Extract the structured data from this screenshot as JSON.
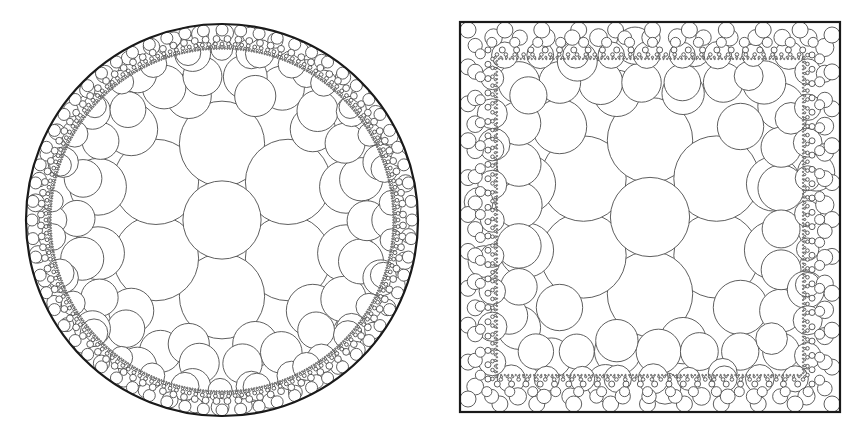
{
  "figure": {
    "background_color": "#ffffff",
    "canvas": {
      "width": 867,
      "height": 441
    },
    "stroke_color": "#4d4d4d",
    "boundary_stroke_color": "#1a1a1a",
    "fill_color": "#ffffff",
    "circle_stroke_width": 0.9,
    "boundary_stroke_width": 2.2
  },
  "panels": [
    {
      "id": "disk-packing",
      "name": "Circle packing in a disk",
      "boundary_kind": "circle",
      "origin": {
        "x": 0,
        "y": 0
      },
      "size": {
        "width": 434,
        "height": 441
      },
      "boundary": {
        "cx": 222,
        "cy": 220,
        "r": 196
      },
      "packing": {
        "seed": 20250117,
        "base_unit": 39.5,
        "center": {
          "x": 222,
          "y": 220
        },
        "rings": [
          {
            "index": 0,
            "count": 1,
            "radius_factor": 1.0,
            "ring_distance": 0.0,
            "phase_deg": 0
          },
          {
            "index": 1,
            "count": 6,
            "radius_factor": 0.93,
            "ring_distance": 1.93,
            "phase_deg": 30
          },
          {
            "index": 2,
            "count": 12,
            "radius_factor": 0.62,
            "ring_distance": 3.25,
            "phase_deg": 15
          },
          {
            "index": 3,
            "count": 18,
            "radius_factor": 0.42,
            "ring_distance": 4.28,
            "phase_deg": 0
          },
          {
            "index": 4,
            "count": 26,
            "radius_factor": 0.25,
            "ring_distance": 4.85,
            "phase_deg": 7
          }
        ],
        "boundary_layers": [
          {
            "index": 0,
            "count": 64,
            "radius_px": 6.0
          },
          {
            "index": 1,
            "count": 104,
            "radius_px": 3.4
          },
          {
            "index": 2,
            "count": 168,
            "radius_px": 1.9
          },
          {
            "index": 3,
            "count": 260,
            "radius_px": 1.15
          },
          {
            "index": 4,
            "count": 400,
            "radius_px": 0.7
          }
        ]
      }
    },
    {
      "id": "square-packing",
      "name": "Circle packing in a square",
      "boundary_kind": "square",
      "origin": {
        "x": 0,
        "y": 0
      },
      "size": {
        "width": 867,
        "height": 441
      },
      "boundary": {
        "x": 460,
        "y": 22,
        "width": 380,
        "height": 390
      },
      "packing": {
        "seed": 77311,
        "base_unit": 40.0,
        "center": {
          "x": 650,
          "y": 217
        },
        "rings": [
          {
            "index": 0,
            "count": 1,
            "radius_factor": 1.0,
            "ring_distance": 0.0,
            "phase_deg": 0
          },
          {
            "index": 1,
            "count": 6,
            "radius_factor": 0.92,
            "ring_distance": 1.92,
            "phase_deg": 30
          },
          {
            "index": 2,
            "count": 12,
            "radius_factor": 0.63,
            "ring_distance": 3.2,
            "phase_deg": 15
          },
          {
            "index": 3,
            "count": 18,
            "radius_factor": 0.43,
            "ring_distance": 4.3,
            "phase_deg": 5
          }
        ],
        "boundary_layers": [
          {
            "index": 0,
            "count": 40,
            "radius_px": 8.0
          },
          {
            "index": 1,
            "count": 60,
            "radius_px": 5.0
          },
          {
            "index": 2,
            "count": 92,
            "radius_px": 3.0
          },
          {
            "index": 3,
            "count": 144,
            "radius_px": 1.8
          },
          {
            "index": 4,
            "count": 224,
            "radius_px": 1.1
          },
          {
            "index": 5,
            "count": 340,
            "radius_px": 0.68
          }
        ]
      }
    }
  ],
  "labels": {
    "disk_caption": "",
    "square_caption": ""
  }
}
